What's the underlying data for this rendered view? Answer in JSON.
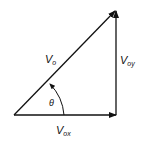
{
  "diagram": {
    "labels": {
      "resultant": {
        "main": "V",
        "sub": "o"
      },
      "horizontal": {
        "main": "V",
        "sub": "ox"
      },
      "vertical": {
        "main": "V",
        "sub": "oy"
      },
      "angle": "θ"
    },
    "colors": {
      "stroke": "#111111",
      "background": "#ffffff"
    }
  }
}
